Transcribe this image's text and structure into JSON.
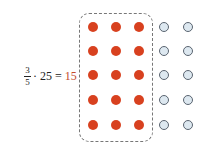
{
  "equation": {
    "numerator": "3",
    "denominator": "5",
    "operator": "· 25 =",
    "result": "15"
  },
  "colors": {
    "filled": "#d8411f",
    "empty_fill": "#dde8f0",
    "result_text": "#c44a2c"
  },
  "grid": {
    "rows": 5,
    "columns": 5,
    "filled_columns": 3,
    "total_dots": 25,
    "filled_dots": 15
  }
}
